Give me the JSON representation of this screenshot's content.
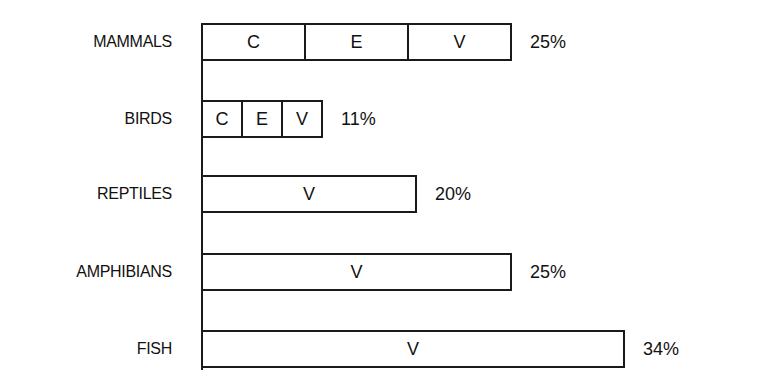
{
  "chart_data": {
    "type": "bar",
    "orientation": "horizontal",
    "title": "",
    "xlabel": "",
    "ylabel": "",
    "grid": false,
    "legend": null,
    "categories": [
      "MAMMALS",
      "BIRDS",
      "REPTILES",
      "AMPHIBIANS",
      "FISH"
    ],
    "values": [
      25,
      11,
      20,
      25,
      34
    ],
    "value_labels": [
      "25%",
      "11%",
      "20%",
      "25%",
      "34%"
    ],
    "segments": [
      [
        "C",
        "E",
        "V"
      ],
      [
        "C",
        "E",
        "V"
      ],
      [
        "V"
      ],
      [
        "V"
      ],
      [
        "V"
      ]
    ],
    "unit": "%"
  },
  "rows": [
    {
      "label": "MAMMALS",
      "pct": "25%",
      "segments": [
        "C",
        "E",
        "V"
      ],
      "top": 23,
      "width": 311
    },
    {
      "label": "BIRDS",
      "pct": "11%",
      "segments": [
        "C",
        "E",
        "V"
      ],
      "top": 100,
      "width": 122
    },
    {
      "label": "REPTILES",
      "pct": "20%",
      "segments": [
        "V"
      ],
      "top": 175,
      "width": 216
    },
    {
      "label": "AMPHIBIANS",
      "pct": "25%",
      "segments": [
        "V"
      ],
      "top": 253,
      "width": 311
    },
    {
      "label": "FISH",
      "pct": "34%",
      "segments": [
        "V"
      ],
      "top": 330,
      "width": 424
    }
  ]
}
